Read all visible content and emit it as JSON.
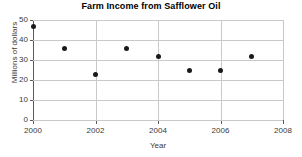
{
  "chart_data": {
    "type": "scatter",
    "title": "Farm Income from Safflower Oil",
    "xlabel": "Year",
    "ylabel": "Millions of dollars",
    "x": [
      2000,
      2001,
      2002,
      2003,
      2004,
      2005,
      2006,
      2007
    ],
    "values": [
      47,
      36,
      23,
      36,
      32,
      25,
      25,
      32
    ],
    "xlim": [
      2000,
      2008
    ],
    "ylim": [
      0,
      50
    ],
    "xticks": [
      2000,
      2002,
      2004,
      2006,
      2008
    ],
    "xtick_labels": [
      "2000",
      "2002",
      "2004",
      "2006",
      "2008"
    ],
    "yticks": [
      0,
      10,
      20,
      30,
      40,
      50
    ],
    "ytick_labels": [
      "0",
      "10",
      "20",
      "30",
      "40",
      "50"
    ],
    "grid": true,
    "grid_axis": "both",
    "legend": null,
    "marker_color": "#1a1a1a",
    "grid_color": "#c9c9c9",
    "axis_color": "#5a5a5a"
  }
}
